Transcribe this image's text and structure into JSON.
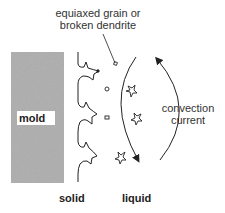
{
  "diagram": {
    "annotation": {
      "line1": "equiaxed grain or",
      "line2": "broken dendrite"
    },
    "mold_label": "mold",
    "convection_label": {
      "line1": "convection",
      "line2": "current"
    },
    "bottom_labels": {
      "solid": "solid",
      "liquid": "liquid"
    },
    "colors": {
      "mold_fill": "#a9a9a9",
      "line": "#222222",
      "text": "#333333",
      "background": "#ffffff"
    }
  }
}
